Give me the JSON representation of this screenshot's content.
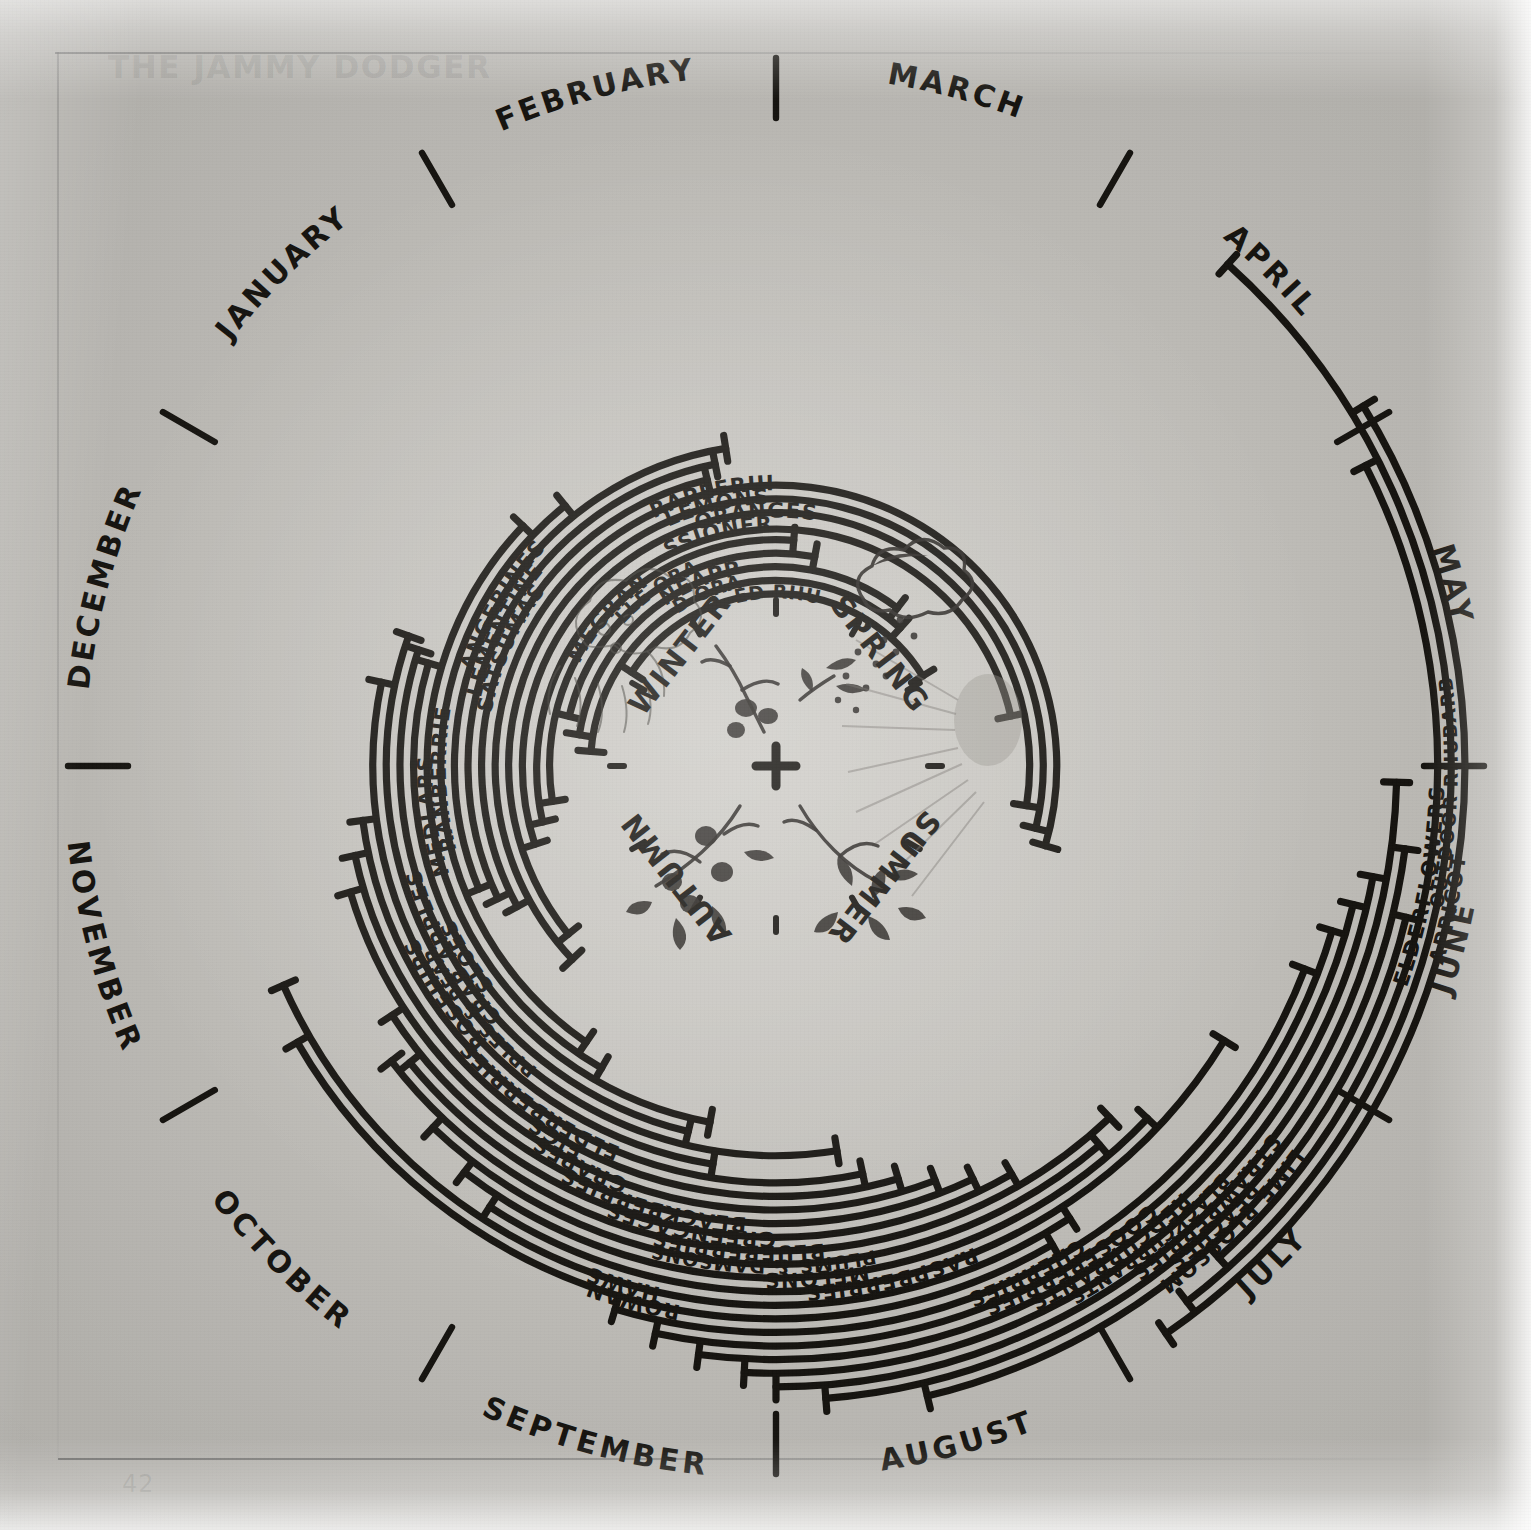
{
  "page": {
    "bleed_title": "THE JAMMY DODGER",
    "page_number": "42"
  },
  "center": {
    "hub_mark": "+",
    "seasons": [
      {
        "name": "WINTER",
        "quadrant": "top-left",
        "motif": "snow-cloud-and-bare-sloe-branch"
      },
      {
        "name": "SPRING",
        "quadrant": "top-right",
        "motif": "rain-cloud-and-seedling"
      },
      {
        "name": "SUMMER",
        "quadrant": "bottom-right",
        "motif": "sun-and-blossoming-branch"
      },
      {
        "name": "AUTUMN",
        "quadrant": "bottom-left",
        "motif": "berry-laden-branch"
      }
    ]
  },
  "chart_data": {
    "type": "radial-gantt",
    "subtitle": "Hand-drawn circular calendar of when each fruit is in season",
    "angular_axis": {
      "label": "Month",
      "unit": "month",
      "start_month": "JANUARY",
      "direction": "clockwise",
      "degrees_per_month": 30,
      "note": "Months run clockwise from JANUARY at the upper-left; month name sits on the outer rim, tick marks divide each month.",
      "categories": [
        "JANUARY",
        "FEBRUARY",
        "MARCH",
        "APRIL",
        "MAY",
        "JUNE",
        "JULY",
        "AUGUST",
        "SEPTEMBER",
        "OCTOBER",
        "NOVEMBER",
        "DECEMBER"
      ]
    },
    "radial_axis": {
      "label": "Ring (one arc per fruit)",
      "note": "Each fruit occupies its own concentric ring; arc length spans its season, with perpendicular end-caps marking first and last month."
    },
    "series": [
      {
        "name": "FORCED RHUBARB",
        "ring": 1,
        "start_month": "JANUARY",
        "end_month": "MARCH",
        "start": 0.1,
        "end": 2.95
      },
      {
        "name": "BLOOD ORANGES",
        "ring": 2,
        "start_month": "DECEMBER",
        "end_month": "MARCH",
        "start": -0.85,
        "end": 2.4
      },
      {
        "name": "PINEAPPLE",
        "ring": 3,
        "start_month": "DECEMBER",
        "end_month": "MARCH",
        "start": -0.7,
        "end": 2.25
      },
      {
        "name": "SEVILLE ORANGES",
        "ring": 4,
        "start_month": "DECEMBER",
        "end_month": "FEBRUARY",
        "start": -0.55,
        "end": 1.35
      },
      {
        "name": "POMEGRANATE",
        "ring": 5,
        "start_month": "NOVEMBER",
        "end_month": "FEBRUARY",
        "start": -1.3,
        "end": 1.15
      },
      {
        "name": "PASSIONFRUIT",
        "ring": 6,
        "start_month": "NOVEMBER",
        "end_month": "APRIL",
        "start": -1.45,
        "end": 3.6
      },
      {
        "name": "ORANGES",
        "ring": 7,
        "start_month": "NOVEMBER",
        "end_month": "MAY",
        "start": -1.6,
        "end": 4.3
      },
      {
        "name": "LEMONS",
        "ring": 8,
        "start_month": "OCTOBER",
        "end_month": "MAY",
        "start": -2.3,
        "end": 4.45
      },
      {
        "name": "GRAPEFRUIT",
        "ring": 9,
        "start_month": "OCTOBER",
        "end_month": "MAY",
        "start": -2.45,
        "end": 4.55
      },
      {
        "name": "SATSUMAS",
        "ring": 10,
        "start_month": "NOVEMBER",
        "end_month": "JANUARY",
        "start": -1.95,
        "end": 0.55
      },
      {
        "name": "CLEMENTINES",
        "ring": 11,
        "start_month": "NOVEMBER",
        "end_month": "JANUARY",
        "start": -1.85,
        "end": 0.62
      },
      {
        "name": "TANGERINES",
        "ring": 12,
        "start_month": "NOVEMBER",
        "end_month": "JANUARY",
        "start": -1.75,
        "end": 0.7
      },
      {
        "name": "CRANBERRIES",
        "ring": 13,
        "start_month": "OCTOBER",
        "end_month": "DECEMBER",
        "start": -2.85,
        "end": -0.3
      },
      {
        "name": "MEDLARS",
        "ring": 14,
        "start_month": "OCTOBER",
        "end_month": "DECEMBER",
        "start": -3.0,
        "end": -0.55
      },
      {
        "name": "SLOES",
        "ring": 15,
        "start_month": "SEPTEMBER",
        "end_month": "NOVEMBER",
        "start": -3.65,
        "end": -1.45
      },
      {
        "name": "CRAB APPLES",
        "ring": 16,
        "start_month": "SEPTEMBER",
        "end_month": "NOVEMBER",
        "start": -3.55,
        "end": -1.4
      },
      {
        "name": "APPLES & PEARS",
        "ring": 17,
        "start_month": "AUGUST",
        "end_month": "NOVEMBER",
        "start": -4.3,
        "end": -1.35
      },
      {
        "name": "ROSEHIPS",
        "ring": 18,
        "start_month": "SEPTEMBER",
        "end_month": "NOVEMBER",
        "start": -3.7,
        "end": -1.6
      },
      {
        "name": "ELDERBERRIES",
        "ring": 19,
        "start_month": "AUGUST",
        "end_month": "OCTOBER",
        "start": -4.4,
        "end": -2.25
      },
      {
        "name": "FIGS",
        "ring": 20,
        "start_month": "AUGUST",
        "end_month": "OCTOBER",
        "start": -4.55,
        "end": -2.4
      },
      {
        "name": "GRAPES",
        "ring": 21,
        "start_month": "AUGUST",
        "end_month": "OCTOBER",
        "start": -4.7,
        "end": -2.55
      },
      {
        "name": "BLACKBERRIES",
        "ring": 22,
        "start_month": "AUGUST",
        "end_month": "SEPTEMBER",
        "start": -4.85,
        "end": -3.1
      },
      {
        "name": "GREENGAGES",
        "ring": 23,
        "start_month": "AUGUST",
        "end_month": "SEPTEMBER",
        "start": -5.0,
        "end": -3.3
      },
      {
        "name": "BLUEBERRIES",
        "ring": 24,
        "start_month": "JULY",
        "end_month": "SEPTEMBER",
        "start": -5.45,
        "end": -3.25
      },
      {
        "name": "PLUMS & DAMSONS",
        "ring": 25,
        "start_month": "JULY",
        "end_month": "SEPTEMBER",
        "start": -5.35,
        "end": -3.55
      },
      {
        "name": "MELONS",
        "ring": 26,
        "start_month": "JULY",
        "end_month": "SEPTEMBER",
        "start": -5.55,
        "end": -3.75
      },
      {
        "name": "RASPBERRIES",
        "ring": 27,
        "start_month": "JUNE",
        "end_month": "SEPTEMBER",
        "start": -5.95,
        "end": -3.9
      },
      {
        "name": "HAWS",
        "ring": 28,
        "start_month": "AUGUST",
        "end_month": "OCTOBER",
        "start": -5.1,
        "end": -2.8
      },
      {
        "name": "ROWAN",
        "ring": 29,
        "start_month": "AUGUST",
        "end_month": "OCTOBER",
        "start": -5.0,
        "end": -3.0
      },
      {
        "name": "CHERRIES",
        "ring": 30,
        "start_month": "JUNE",
        "end_month": "AUGUST",
        "start": -6.3,
        "end": -4.45
      },
      {
        "name": "GOOSEBERRIES",
        "ring": 31,
        "start_month": "JUNE",
        "end_month": "AUGUST",
        "start": -6.45,
        "end": -4.6
      },
      {
        "name": "REDCURRANTS",
        "ring": 32,
        "start_month": "JUNE",
        "end_month": "AUGUST",
        "start": -6.55,
        "end": -4.75
      },
      {
        "name": "BLACKCURRANTS",
        "ring": 33,
        "start_month": "JUNE",
        "end_month": "AUGUST",
        "start": -6.65,
        "end": -4.9
      },
      {
        "name": "STRAWBERRIES",
        "ring": 34,
        "start_month": "MAY",
        "end_month": "AUGUST",
        "start": -6.95,
        "end": -5.0
      },
      {
        "name": "PEACHES",
        "ring": 35,
        "start_month": "JUNE",
        "end_month": "AUGUST",
        "start": -6.75,
        "end": -5.15
      },
      {
        "name": "LIME BLOSSOM",
        "ring": 36,
        "start_month": "JUNE",
        "end_month": "JULY",
        "start": -6.55,
        "end": -5.45
      },
      {
        "name": "ELDERFLOWERS",
        "ring": 37,
        "start_month": "MAY",
        "end_month": "JUNE",
        "start": 4.1,
        "end": 5.6
      },
      {
        "name": "OUTDOOR RHUBARB",
        "ring": 38,
        "start_month": "APRIL",
        "end_month": "JUNE",
        "start": 3.4,
        "end": 5.75
      },
      {
        "name": "APRICOT",
        "ring": 39,
        "start_month": "MAY",
        "end_month": "JUNE",
        "start": 3.95,
        "end": 5.85
      }
    ]
  }
}
